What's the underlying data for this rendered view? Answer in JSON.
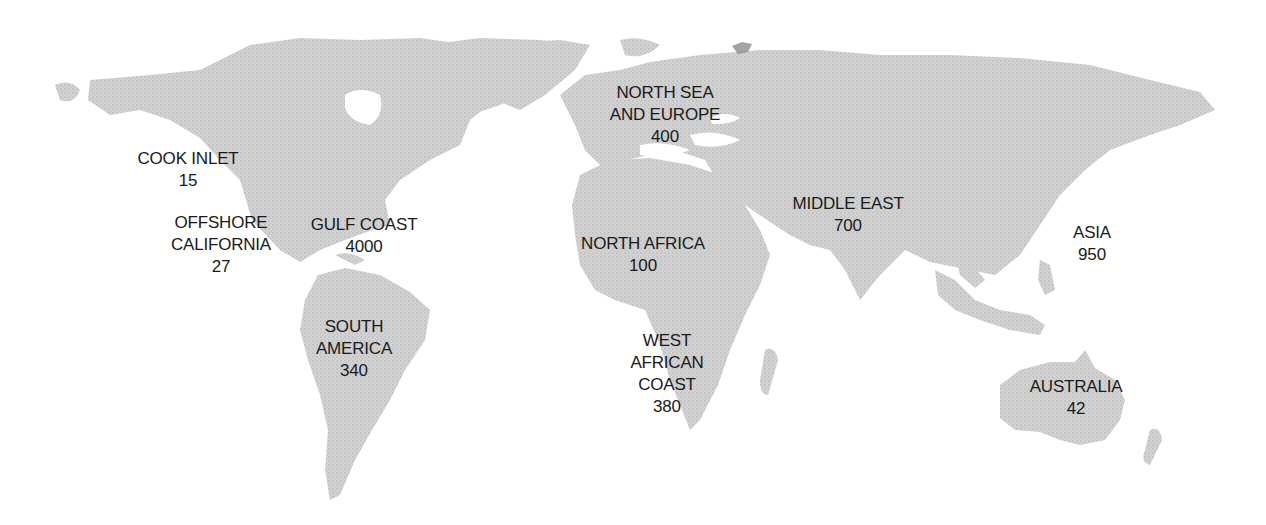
{
  "map": {
    "type": "world-map",
    "land_color": "#cfcfcf",
    "label_color": "#1a1a1a",
    "background": "#ffffff"
  },
  "regions": [
    {
      "id": "cook-inlet",
      "name_lines": [
        "COOK INLET"
      ],
      "value": "15",
      "x": 188,
      "y": 148
    },
    {
      "id": "offshore-california",
      "name_lines": [
        "OFFSHORE",
        "CALIFORNIA"
      ],
      "value": "27",
      "x": 221,
      "y": 212
    },
    {
      "id": "gulf-coast",
      "name_lines": [
        "GULF COAST"
      ],
      "value": "4000",
      "x": 364,
      "y": 214
    },
    {
      "id": "south-america",
      "name_lines": [
        "SOUTH",
        "AMERICA"
      ],
      "value": "340",
      "x": 354,
      "y": 316
    },
    {
      "id": "north-sea-europe",
      "name_lines": [
        "NORTH SEA",
        "AND EUROPE"
      ],
      "value": "400",
      "x": 665,
      "y": 82
    },
    {
      "id": "north-africa",
      "name_lines": [
        "NORTH AFRICA"
      ],
      "value": "100",
      "x": 643,
      "y": 233
    },
    {
      "id": "middle-east",
      "name_lines": [
        "MIDDLE EAST"
      ],
      "value": "700",
      "x": 848,
      "y": 193
    },
    {
      "id": "west-african-coast",
      "name_lines": [
        "WEST",
        "AFRICAN",
        "COAST"
      ],
      "value": "380",
      "x": 667,
      "y": 330
    },
    {
      "id": "asia",
      "name_lines": [
        "ASIA"
      ],
      "value": "950",
      "x": 1092,
      "y": 222
    },
    {
      "id": "australia",
      "name_lines": [
        "AUSTRALIA"
      ],
      "value": "42",
      "x": 1076,
      "y": 376
    }
  ]
}
